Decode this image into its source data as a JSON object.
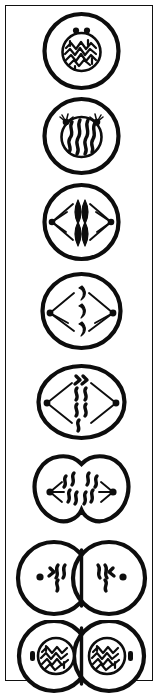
{
  "figure": {
    "title": "Mitosis — stages of cell division",
    "orientation": "vertical",
    "panel_count": 8,
    "background_color": "#ffffff",
    "ink_color": "#0d0d0d",
    "border": {
      "visible": true,
      "color": "#111111",
      "style": "solid rectangle"
    }
  },
  "diagram_data": {
    "type": "diagram",
    "subject": "mitosis",
    "sequence_direction": "top-to-bottom",
    "stages": [
      {
        "index": 1,
        "name": "interphase",
        "label": "Interphase",
        "cell_shape": "circle",
        "nucleus": true,
        "nuclear_envelope": true,
        "chromatin_form": "tangled-maze",
        "centriole_count": 2,
        "centriole_position": "above-nucleus-paired",
        "spindle": false,
        "cleavage_furrow": false,
        "cell_count": 1
      },
      {
        "index": 2,
        "name": "early-prophase",
        "label": "Early prophase",
        "cell_shape": "circle",
        "nucleus": true,
        "nuclear_envelope": true,
        "chromatin_form": "condensing-wavy-threads",
        "chromosome_count": 4,
        "centriole_count": 2,
        "centriole_position": "upper-left-and-upper-right-with-asters",
        "spindle": false,
        "cleavage_furrow": false,
        "cell_count": 1
      },
      {
        "index": 3,
        "name": "late-prophase",
        "label": "Late prophase",
        "cell_shape": "circle",
        "nucleus": false,
        "nuclear_envelope": false,
        "chromatin_form": "condensed-spindle-shaped-chromosomes",
        "chromosome_count": 4,
        "centriole_count": 2,
        "centriole_position": "opposite-poles-left-right",
        "spindle": true,
        "spindle_shape": "diamond",
        "cleavage_furrow": false,
        "cell_count": 1
      },
      {
        "index": 4,
        "name": "metaphase",
        "label": "Metaphase",
        "cell_shape": "circle",
        "nucleus": false,
        "nuclear_envelope": false,
        "chromatin_form": "thick-comma-chromosomes-on-equator",
        "chromosome_count": 3,
        "centriole_count": 2,
        "centriole_position": "opposite-poles-left-right",
        "spindle": true,
        "spindle_shape": "diamond",
        "cleavage_furrow": false,
        "cell_count": 1
      },
      {
        "index": 5,
        "name": "anaphase",
        "label": "Anaphase",
        "cell_shape": "oval-elongated",
        "nucleus": false,
        "nuclear_envelope": false,
        "chromatin_form": "wavy-chromosomes-separating",
        "chromosome_count": 6,
        "centriole_count": 2,
        "centriole_position": "opposite-poles-left-right",
        "spindle": true,
        "spindle_shape": "diamond",
        "cleavage_furrow": false,
        "cell_count": 1
      },
      {
        "index": 6,
        "name": "telophase",
        "label": "Telophase",
        "cell_shape": "bilobed-pinching",
        "nucleus": false,
        "nuclear_envelope": false,
        "chromatin_form": "wavy-chromosome-clusters-at-poles",
        "chromosome_count": 6,
        "centriole_count": 2,
        "centriole_position": "opposite-poles-left-right",
        "spindle": true,
        "spindle_shape": "short-rays-at-each-pole",
        "cleavage_furrow": true,
        "furrow_depth": "shallow",
        "cell_count": 1
      },
      {
        "index": 7,
        "name": "cytokinesis",
        "label": "Cytokinesis",
        "cell_shape": "two-touching-circles",
        "nucleus": false,
        "nuclear_envelope": false,
        "chromatin_form": "wavy-chromosome-clusters",
        "chromosome_count": 6,
        "centriole_count": 2,
        "centriole_position": "one-per-daughter-cell",
        "spindle": false,
        "cleavage_furrow": true,
        "furrow_depth": "complete-straight-division-line",
        "cell_count": 2
      },
      {
        "index": 8,
        "name": "daughter-cells",
        "label": "Two daughter cells",
        "cell_shape": "two-touching-circles",
        "nucleus": true,
        "nuclear_envelope": true,
        "chromatin_form": "tangled-maze",
        "centriole_count": 2,
        "centriole_position": "outer-side-of-each-daughter-cell",
        "spindle": false,
        "cleavage_furrow": true,
        "furrow_depth": "complete-straight-division-line",
        "cell_count": 2
      }
    ]
  }
}
